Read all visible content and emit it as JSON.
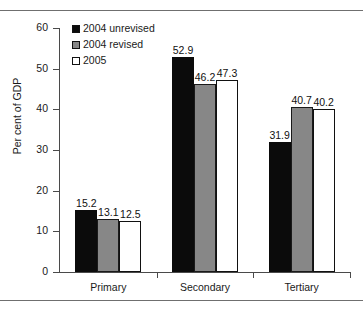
{
  "chart_data": {
    "type": "bar",
    "title": "",
    "xlabel": "",
    "ylabel": "Per cent of GDP",
    "ylim": [
      0,
      60
    ],
    "ytick_labels": [
      "0",
      "10",
      "20",
      "30",
      "40",
      "50",
      "60"
    ],
    "ytick_values": [
      0,
      10,
      20,
      30,
      40,
      50,
      60
    ],
    "grid": false,
    "legend_position": "top-left",
    "categories": [
      "Primary",
      "Secondary",
      "Tertiary"
    ],
    "series": [
      {
        "name": "2004 unrevised",
        "color": "#0b0b0b",
        "values": [
          15.2,
          52.9,
          31.9
        ],
        "labels": [
          "15.2",
          "52.9",
          "31.9"
        ]
      },
      {
        "name": "2004 revised",
        "color": "#878787",
        "values": [
          13.1,
          46.2,
          40.7
        ],
        "labels": [
          "13.1",
          "46.2",
          "40.7"
        ]
      },
      {
        "name": "2005",
        "color": "#ffffff",
        "values": [
          12.5,
          47.3,
          40.2
        ],
        "labels": [
          "12.5",
          "47.3",
          "40.2"
        ]
      }
    ]
  }
}
